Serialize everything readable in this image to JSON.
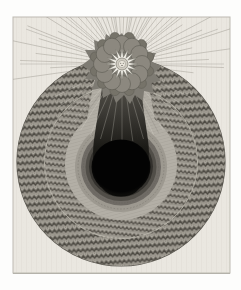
{
  "artwork": {
    "alt": "Antique engraving plate: a radiant sun with a starburst face at top, surrounded by scalloped clouds, rays fanning outward, above a large circle of zigzag-patterned concentric rings descending into a black oval void",
    "palette": {
      "page_bg": "#fdfdfc",
      "paper": "#eae7e0",
      "paper_line": "#e0ddd5",
      "plate_edge": "#bdbab1",
      "plate_shadow": "#aba89f",
      "ray": "#a19d94",
      "ray_dark": "#716e66",
      "ray_light": "#dedbd2",
      "ray_inner_dark": "#3f3d38",
      "circle_base": "#8f8b82",
      "rim": "#5c5952",
      "zig_outer_base": "#8f8b82",
      "zig_outer_dark": "#4d4a43",
      "zig_outer_light": "#c4c0b6",
      "zig_mid_base": "#99958c",
      "zig_mid_dark": "#57534c",
      "zig_mid_light": "#cac6bc",
      "band_light": "#b3afa6",
      "band_light_line": "#908c83",
      "separator": "#c6c2b8",
      "ring1": "#9d9990",
      "ring2": "#6f6b65",
      "ring3": "#514e48",
      "ring4": "#33312d",
      "ring_texture": "#5b5851",
      "void_core": "#030303",
      "void_edge": "#191813",
      "chimney_top": "#5a574f",
      "chimney_mid": "#3b3934",
      "chimney_low": "#1b1a16",
      "chimney_base": "#0a0a08",
      "cloud_silhouette": "#7e7b73",
      "cloud_puff": "#8c887f",
      "cloud_puff_dark": "#767369",
      "cloud_puff_stroke": "#5d5a53",
      "star_white": "#f4f2eb",
      "star_stroke": "#7b786f",
      "star_core_ring": "#cfcbc1",
      "face_bg": "#e9e5db",
      "face_marks": "#6b6860"
    }
  }
}
